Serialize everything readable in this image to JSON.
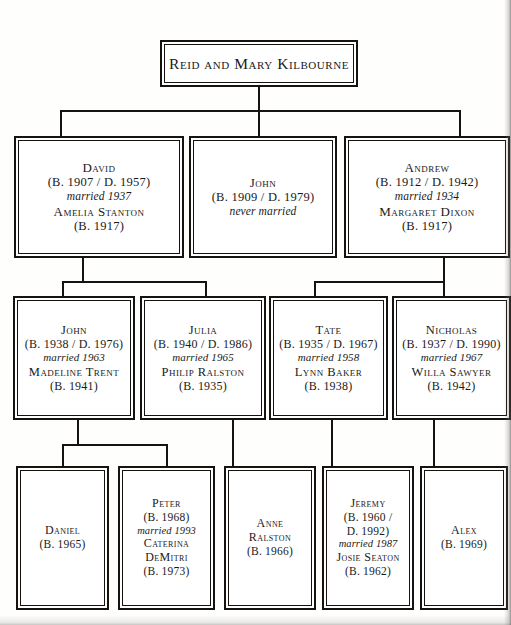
{
  "diagram": {
    "type": "family-tree",
    "ink_color": "#15120f",
    "page_color": "#fefefd"
  },
  "generation1": {
    "root": {
      "name": "Reid and Mary Kilbourne"
    }
  },
  "generation2": [
    {
      "name": "David",
      "years": "(B. 1907 / D. 1957)",
      "married": "married 1937",
      "spouse": "Amelia Stanton",
      "spouse_years": "(B. 1917)"
    },
    {
      "name": "John",
      "years": "(B. 1909 / D. 1979)",
      "married": "never married",
      "spouse": "",
      "spouse_years": ""
    },
    {
      "name": "Andrew",
      "years": "(B. 1912 / D. 1942)",
      "married": "married 1934",
      "spouse": "Margaret Dixon",
      "spouse_years": "(B. 1917)"
    }
  ],
  "generation3": [
    {
      "name": "John",
      "years": "(B. 1938 / D. 1976)",
      "married": "married 1963",
      "spouse": "Madeline Trent",
      "spouse_years": "(B. 1941)"
    },
    {
      "name": "Julia",
      "years": "(B. 1940 / D. 1986)",
      "married": "married 1965",
      "spouse": "Philip Ralston",
      "spouse_years": "(B. 1935)"
    },
    {
      "name": "Tate",
      "years": "(B. 1935 / D. 1967)",
      "married": "married 1958",
      "spouse": "Lynn Baker",
      "spouse_years": "(B. 1938)"
    },
    {
      "name": "Nicholas",
      "years": "(B. 1937 / D. 1990)",
      "married": "married 1967",
      "spouse": "Willa Sawyer",
      "spouse_years": "(B. 1942)"
    }
  ],
  "generation4": [
    {
      "name": "Daniel",
      "years": "(B. 1965)",
      "married": "",
      "spouse": "",
      "spouse2": "",
      "spouse_years": ""
    },
    {
      "name": "Peter",
      "years": "(B. 1968)",
      "married": "married 1993",
      "spouse": "Caterina",
      "spouse2": "DeMitri",
      "spouse_years": "(B. 1973)"
    },
    {
      "name": "Anne",
      "name2": "Ralston",
      "years": "(B. 1966)",
      "married": "",
      "spouse": "",
      "spouse_years": ""
    },
    {
      "name": "Jeremy",
      "years": "(B. 1960 /",
      "years2": "D. 1992)",
      "married": "married 1987",
      "spouse": "Josie Seaton",
      "spouse_years": "(B. 1962)"
    },
    {
      "name": "Alex",
      "years": "(B. 1969)",
      "married": "",
      "spouse": "",
      "spouse_years": ""
    }
  ]
}
